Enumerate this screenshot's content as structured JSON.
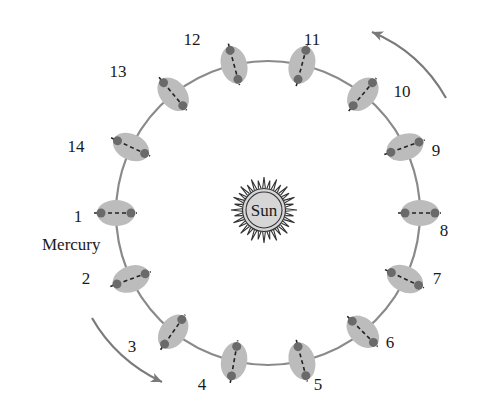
{
  "colors": {
    "orbit": "#8a8a8a",
    "planet_fill": "#bcbcbc",
    "marker": "#6a6a6a",
    "axis": "#222222",
    "sun_fill": "#d6d6d6",
    "sun_stroke": "#333333",
    "arrow": "#7a7a7a",
    "text": "#1a1a1a"
  },
  "orbit": {
    "cx": 268,
    "cy": 213,
    "r": 152
  },
  "sun": {
    "cx": 264,
    "cy": 210,
    "r": 20,
    "ray_inner": 22,
    "ray_outer": 33,
    "rays": 32,
    "label": "Sun"
  },
  "planet_name": {
    "text": "Mercury",
    "x": 42,
    "y": 250
  },
  "planet": {
    "rx": 19,
    "ry": 13,
    "marker_r": 4.5
  },
  "positions": [
    {
      "n": "1",
      "angle": 180,
      "axis": 0,
      "lx": 78,
      "ly": 222
    },
    {
      "n": "2",
      "angle": 154.3,
      "axis": -20,
      "lx": 86,
      "ly": 284
    },
    {
      "n": "3",
      "angle": 128.6,
      "axis": -55,
      "lx": 132,
      "ly": 352
    },
    {
      "n": "4",
      "angle": 102.9,
      "axis": -80,
      "lx": 202,
      "ly": 390
    },
    {
      "n": "5",
      "angle": 77.1,
      "axis": 75,
      "lx": 318,
      "ly": 390
    },
    {
      "n": "6",
      "angle": 51.4,
      "axis": 45,
      "lx": 390,
      "ly": 348
    },
    {
      "n": "7",
      "angle": 25.7,
      "axis": 25,
      "lx": 437,
      "ly": 284
    },
    {
      "n": "8",
      "angle": 0,
      "axis": 0,
      "lx": 444,
      "ly": 236
    },
    {
      "n": "9",
      "angle": -25.7,
      "axis": -20,
      "lx": 436,
      "ly": 156
    },
    {
      "n": "10",
      "angle": -51.4,
      "axis": -50,
      "lx": 402,
      "ly": 97
    },
    {
      "n": "11",
      "angle": -77.1,
      "axis": -75,
      "lx": 312,
      "ly": 45
    },
    {
      "n": "12",
      "angle": -102.9,
      "axis": 75,
      "lx": 192,
      "ly": 45
    },
    {
      "n": "13",
      "angle": -128.6,
      "axis": 50,
      "lx": 118,
      "ly": 77
    },
    {
      "n": "14",
      "angle": -154.3,
      "axis": 25,
      "lx": 76,
      "ly": 152
    }
  ],
  "arrows": [
    {
      "name": "direction-arrow-top-right",
      "d": "M 446 98 Q 420 52 372 32",
      "head": [
        372,
        32
      ],
      "head_angle": -158
    },
    {
      "name": "direction-arrow-bottom-left",
      "d": "M 92 318 Q 116 360 162 382",
      "head": [
        162,
        382
      ],
      "head_angle": 24
    }
  ]
}
